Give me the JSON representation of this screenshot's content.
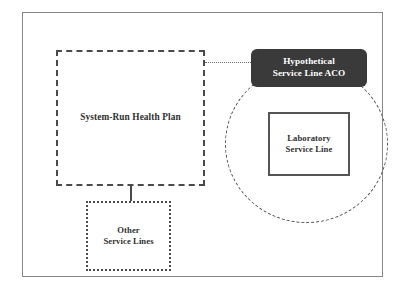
{
  "diagram": {
    "title": "Hypothetical Service Line ACO",
    "background_color": "#ffffff",
    "frame": {
      "border_color": "#888888"
    },
    "nodes": {
      "health_plan": {
        "label": "System-Run Health Plan",
        "border_style": "dashed",
        "border_color": "#4a4a4a",
        "fill": "#ffffff",
        "text_color": "#2f2f2f"
      },
      "other_service_lines": {
        "label": "Other\nService Lines",
        "border_style": "dotted",
        "border_color": "#4a4a4a",
        "fill": "#ffffff",
        "text_color": "#2f2f2f"
      },
      "aco_label": {
        "label": "Hypothetical\nService Line ACO",
        "border_style": "none",
        "fill": "#3a3a3a",
        "text_color": "#ffffff"
      },
      "laboratory_service_line": {
        "label": "Laboratory\nService Line",
        "border_style": "solid",
        "border_color": "#555555",
        "fill": "#ffffff",
        "text_color": "#2f2f2f"
      }
    },
    "boundary": {
      "name": "aco-boundary-circle",
      "shape": "circle",
      "border_style": "dashed",
      "border_color": "#555555"
    },
    "connectors": [
      {
        "name": "health-plan-to-other-service-lines",
        "style": "solid",
        "orientation": "vertical",
        "color": "#4a4a4a"
      },
      {
        "name": "health-plan-to-aco",
        "style": "dotted",
        "orientation": "horizontal",
        "color": "#6b6b6b"
      }
    ]
  }
}
